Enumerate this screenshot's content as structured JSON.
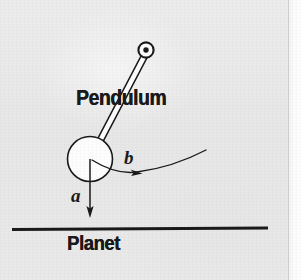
{
  "figure": {
    "kind": "physics-diagram",
    "background_color": "#e9e9e9",
    "ink_color": "#1a1a1a"
  },
  "labels": {
    "pendulum": "Pendulum",
    "planet": "Planet",
    "vector_a": "a",
    "vector_b": "b"
  },
  "geometry": {
    "pivot": {
      "x": 146,
      "y": 50,
      "outer_radius": 7.5,
      "dot_radius": 2.6
    },
    "bob": {
      "x": 90,
      "y": 159,
      "radius": 23
    },
    "rod": {
      "x1": 144,
      "y1": 57,
      "x2": 92,
      "y2": 157,
      "width": 5
    },
    "ground_line": {
      "x1": 12,
      "y1": 229,
      "x2": 268,
      "y2": 228,
      "thickness": 3
    },
    "arrow_a": {
      "x1": 90,
      "y1": 159,
      "x2": 90,
      "y2": 216
    },
    "arrow_b": {
      "x1": 92,
      "y1": 160,
      "x2": 205,
      "y2": 152,
      "tip_x": 137,
      "tip_y": 172
    }
  }
}
